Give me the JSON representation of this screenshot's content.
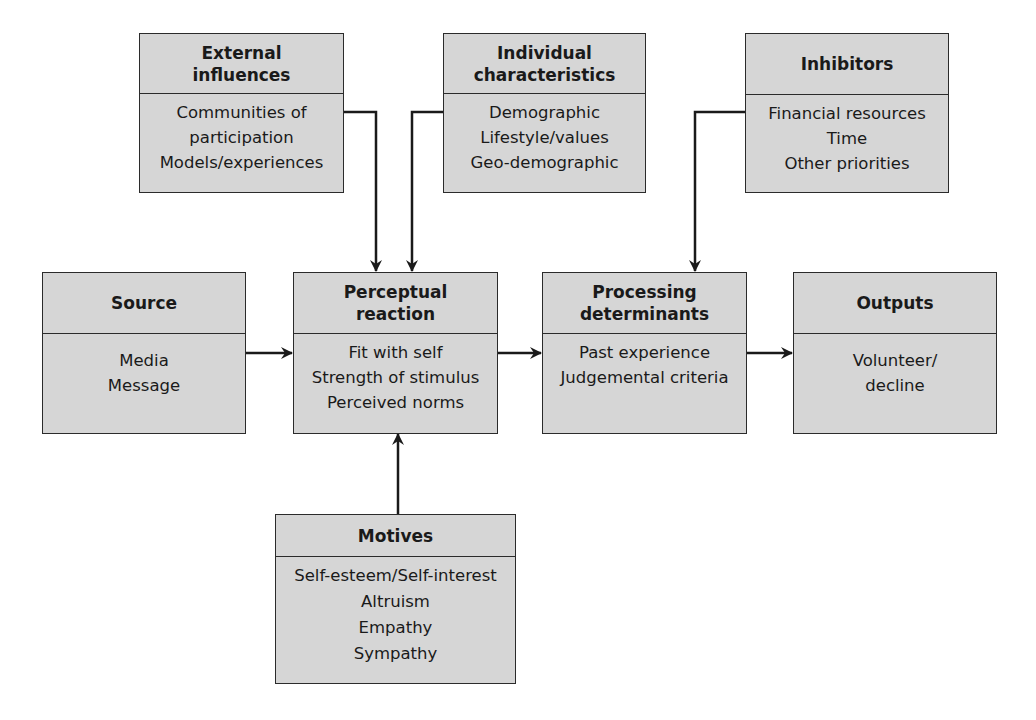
{
  "diagram": {
    "boxes": [
      {
        "id": "external",
        "title_lines": [
          "External",
          "influences"
        ],
        "items": [
          "Communities of",
          "participation",
          "Models/experiences"
        ]
      },
      {
        "id": "individual",
        "title_lines": [
          "Individual",
          "characteristics"
        ],
        "items": [
          "Demographic",
          "Lifestyle/values",
          "Geo-demographic"
        ]
      },
      {
        "id": "inhibitors",
        "title_lines": [
          "Inhibitors"
        ],
        "items": [
          "Financial resources",
          "Time",
          "Other priorities"
        ]
      },
      {
        "id": "source",
        "title_lines": [
          "Source"
        ],
        "items": [
          "Media",
          "Message"
        ]
      },
      {
        "id": "perceptual",
        "title_lines": [
          "Perceptual",
          "reaction"
        ],
        "items": [
          "Fit with self",
          "Strength of stimulus",
          "Perceived norms"
        ]
      },
      {
        "id": "processing",
        "title_lines": [
          "Processing",
          "determinants"
        ],
        "items": [
          "Past experience",
          "Judgemental criteria"
        ]
      },
      {
        "id": "outputs",
        "title_lines": [
          "Outputs"
        ],
        "items": [
          "Volunteer/",
          "decline"
        ]
      },
      {
        "id": "motives",
        "title_lines": [
          "Motives"
        ],
        "items": [
          "Self-esteem/Self-interest",
          "Altruism",
          "Empathy",
          "Sympathy"
        ]
      }
    ],
    "connections": [
      {
        "from": "external",
        "to": "perceptual"
      },
      {
        "from": "individual",
        "to": "perceptual"
      },
      {
        "from": "inhibitors",
        "to": "processing"
      },
      {
        "from": "source",
        "to": "perceptual"
      },
      {
        "from": "perceptual",
        "to": "processing"
      },
      {
        "from": "processing",
        "to": "outputs"
      },
      {
        "from": "motives",
        "to": "perceptual"
      }
    ],
    "colors": {
      "box_fill": "#d6d6d6",
      "line": "#1a1a1a",
      "background": "#ffffff"
    }
  }
}
